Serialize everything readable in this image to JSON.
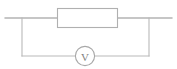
{
  "figure": {
    "width": 177,
    "height": 69,
    "background_color": "#ffffff"
  },
  "colors": {
    "wire": "#8d8d8d",
    "wire_light": "#b9b9b9",
    "component_outline": "#b0b0b0",
    "meter_outline": "#a8a8a8",
    "label_text": "#7f7f7f",
    "fill": "#ffffff"
  },
  "components": {
    "resistor": {
      "name": "resistor",
      "symbol": "rectangle",
      "label": "",
      "x": 57,
      "y": 8,
      "width": 61,
      "height": 20
    },
    "voltmeter": {
      "name": "voltmeter",
      "symbol": "circle-with-letter",
      "label": "V",
      "cx": 85,
      "cy": 56,
      "r": 10
    }
  },
  "wires": {
    "top_left_lead": {
      "x1": 5,
      "y1": 18,
      "x2": 57,
      "y2": 18
    },
    "top_right_lead": {
      "x1": 118,
      "y1": 18,
      "x2": 172,
      "y2": 18
    },
    "left_branch_vertical": {
      "x1": 22,
      "y1": 18,
      "x2": 22,
      "y2": 56
    },
    "right_branch_vertical": {
      "x1": 149,
      "y1": 18,
      "x2": 149,
      "y2": 56
    },
    "bottom_left_segment": {
      "x1": 22,
      "y1": 56,
      "x2": 75,
      "y2": 56
    },
    "bottom_right_segment": {
      "x1": 95,
      "y1": 56,
      "x2": 149,
      "y2": 56
    }
  }
}
